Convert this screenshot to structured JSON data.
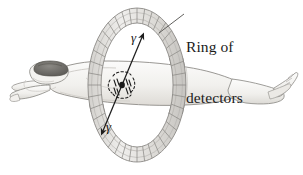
{
  "figure": {
    "background_color": "#ffffff",
    "width": 303,
    "height": 175
  },
  "labels": {
    "ring_of_detectors": {
      "line1": "Ring of",
      "line2": "detectors"
    },
    "gamma_upper": "γ",
    "gamma_lower": "γ"
  },
  "colors": {
    "ink": "#1b1b1b",
    "body_fill": "#f2f1ef",
    "body_line": "#8e8c88",
    "body_shade": "#dedcd8",
    "hair": "#6c6a66",
    "ring_fill": "#e8e7e4",
    "ring_line": "#8b8986",
    "ring_shade": "#cfcdc9",
    "ray_line": "#1d1d1d",
    "annihilation_dot": "#1a1a1a"
  },
  "elements": {
    "detector_ring": {
      "name": "detector-ring",
      "shape": "segmented elliptical torus",
      "segment_count": 40,
      "center_x": 137,
      "center_y": 85,
      "outer_rx": 49,
      "outer_ry": 77,
      "inner_rx": 36,
      "inner_ry": 62
    },
    "patient": {
      "name": "patient-figure",
      "pose": "supine, head at left, feet at right",
      "head_x": 42,
      "feet_x": 290
    },
    "gamma_ray_path": {
      "name": "gamma-ray-line",
      "from_x": 102,
      "from_y": 133,
      "to_x": 143,
      "to_y": 35,
      "arrowheads": "both ends"
    },
    "annihilation_point": {
      "name": "annihilation-point",
      "x": 122,
      "y": 85
    },
    "leader_line": {
      "name": "label-leader-line",
      "from_x": 184,
      "from_y": 14,
      "to_x": 160,
      "to_y": 33
    }
  }
}
